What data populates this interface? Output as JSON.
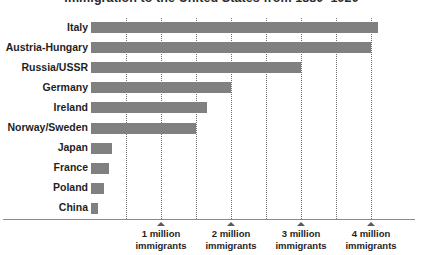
{
  "chart_data": {
    "type": "bar",
    "orientation": "horizontal",
    "title": "Immigration to the United States from 1880–1920",
    "xlabel": "",
    "ylabel": "",
    "unit": "immigrants",
    "xlim": [
      0,
      4.45
    ],
    "grid": true,
    "grid_step": 0.5,
    "legend": "none",
    "bar_color": "#808080",
    "axis_color": "#8a8a8a",
    "gridline_color": "#6f6f6f",
    "categories": [
      "Italy",
      "Austria-Hungary",
      "Russia/USSR",
      "Germany",
      "Ireland",
      "Norway/Sweden",
      "Japan",
      "France",
      "Poland",
      "China"
    ],
    "values": [
      4.1,
      4.0,
      3.0,
      2.0,
      1.65,
      1.5,
      0.3,
      0.25,
      0.18,
      0.1
    ],
    "tick_values": [
      1,
      2,
      3,
      4
    ],
    "tick_labels": [
      {
        "line1": "1 million",
        "line2": "immigrants"
      },
      {
        "line1": "2 million",
        "line2": "immigrants"
      },
      {
        "line1": "3 million",
        "line2": "immigrants"
      },
      {
        "line1": "4 million",
        "line2": "immigrants"
      }
    ]
  }
}
